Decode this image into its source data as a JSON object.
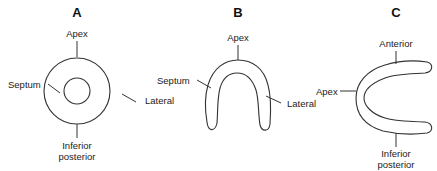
{
  "panels": [
    {
      "id": "A",
      "letter": "A",
      "shape": "concentric-circles",
      "labels": {
        "top": "Apex",
        "left": "Septum",
        "right": "Lateral",
        "bottom_line1": "Inferior",
        "bottom_line2": "posterior"
      }
    },
    {
      "id": "B",
      "letter": "B",
      "shape": "inverted-u",
      "labels": {
        "top": "Apex",
        "left": "Septum",
        "right": "Lateral"
      }
    },
    {
      "id": "C",
      "letter": "C",
      "shape": "c-shape",
      "labels": {
        "top": "Anterior",
        "left": "Apex",
        "bottom_line1": "Inferior",
        "bottom_line2": "posterior"
      }
    }
  ],
  "colors": {
    "background": "#ffffff",
    "stroke": "#333333",
    "text": "#222222"
  }
}
